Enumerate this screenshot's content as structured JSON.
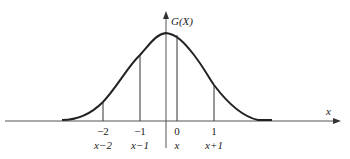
{
  "figure": {
    "y_axis_label": "G(X)",
    "x_axis_label": "x",
    "curve": "bell-shaped (normal) density curve G(X)",
    "ticks": [
      {
        "top": "−2",
        "bottom": "x−2"
      },
      {
        "top": "−1",
        "bottom": "x−1"
      },
      {
        "top": "0",
        "bottom": "x"
      },
      {
        "top": "1",
        "bottom": "x+1"
      }
    ],
    "colors": {
      "line": "#222222",
      "axis": "#555555",
      "background": "#ffffff"
    }
  }
}
